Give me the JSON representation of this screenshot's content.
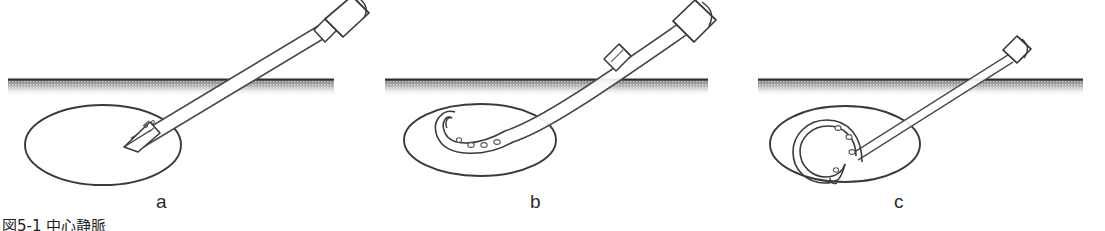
{
  "figure": {
    "background_color": "#ffffff",
    "line_color": "#3a3a3a",
    "fill_color": "#ffffff",
    "skin_line_color": "#2e2e2e",
    "tissue_band_color": "#b9b9b9",
    "label_color": "#2b2b2b",
    "caption_text": "図5-1 中心静脈",
    "panels": [
      {
        "id": "a",
        "label": "a",
        "description": "Needle with bevelled tip punctures through skin into vessel",
        "device": "puncture-needle",
        "hubs": 1,
        "catheter_shape": "none",
        "vessel_ellipse": {
          "cx": 103,
          "cy": 145,
          "rx": 78,
          "ry": 40
        },
        "needle_tip": {
          "x": 125,
          "y": 145
        },
        "needle_hub": {
          "x": 339,
          "y": 16
        }
      },
      {
        "id": "b",
        "label": "b",
        "description": "Catheter advanced off the needle, curving inside the vessel",
        "device": "catheter-over-needle",
        "hubs": 2,
        "catheter_shape": "hook",
        "vessel_ellipse": {
          "cx": 480,
          "cy": 140,
          "rx": 76,
          "ry": 36
        },
        "catheter_tip": {
          "x": 451,
          "y": 122
        },
        "needle_hub": {
          "x": 700,
          "y": 18
        }
      },
      {
        "id": "c",
        "label": "c",
        "description": "Catheter fully coiled within the vessel lumen",
        "device": "coiled-catheter",
        "hubs": 1,
        "catheter_shape": "coil",
        "vessel_ellipse": {
          "cx": 845,
          "cy": 144,
          "rx": 75,
          "ry": 38
        },
        "coil_center": {
          "cx": 837,
          "cy": 146,
          "r": 24
        },
        "needle_hub": {
          "x": 1022,
          "y": 48
        }
      }
    ],
    "skin_line": {
      "y": 79,
      "segments": [
        {
          "x1": 8,
          "x2": 334
        },
        {
          "x1": 385,
          "x2": 708
        },
        {
          "x1": 758,
          "x2": 1083
        }
      ],
      "band_height": 14
    }
  }
}
